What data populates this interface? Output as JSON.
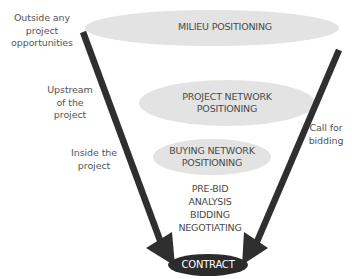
{
  "diagram": {
    "type": "funnel",
    "stages": [
      {
        "id": "milieu",
        "label": "MILIEU POSITIONING"
      },
      {
        "id": "project_network",
        "label_line1": "PROJECT NETWORK",
        "label_line2": "POSITIONING"
      },
      {
        "id": "buying_network",
        "label_line1": "BUYING NETWORK",
        "label_line2": "POSITIONING"
      }
    ],
    "process_steps": [
      "PRE-BID",
      "ANALYSIS",
      "BIDDING",
      "NEGOTIATING"
    ],
    "outcome": "CONTRACT",
    "left_labels": [
      {
        "lines": [
          "Outside any",
          "project",
          "opportunities"
        ]
      },
      {
        "lines": [
          "Upstream",
          "of the",
          "project"
        ]
      },
      {
        "lines": [
          "Inside the",
          "project"
        ]
      }
    ],
    "right_label": {
      "lines": [
        "Call for",
        "bidding"
      ]
    },
    "colors": {
      "ellipse_fill": "#e3e3e3",
      "arrow": "#2f2f2f",
      "contract_fill": "#2b2b2b",
      "contract_text": "#ffffff",
      "text": "#4a4a4a"
    }
  }
}
